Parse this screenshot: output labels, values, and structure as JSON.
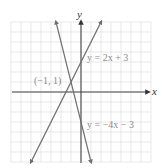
{
  "chart_data": {
    "type": "line",
    "title": "",
    "xlabel": "x",
    "ylabel": "y",
    "xlim": [
      -7,
      7
    ],
    "ylim": [
      -7,
      7
    ],
    "grid": true,
    "legend": null,
    "series": [
      {
        "name": "y = 2x + 3",
        "equation": "y = 2x + 3",
        "slope": 2,
        "intercept": 3,
        "x": [
          -5,
          2
        ],
        "y": [
          -7,
          7
        ]
      },
      {
        "name": "y = −4x − 3",
        "equation": "y = −4x − 3",
        "slope": -4,
        "intercept": -3,
        "x": [
          -2.5,
          1
        ],
        "y": [
          7,
          -7
        ]
      }
    ],
    "annotations": [
      {
        "text": "(−1, 1)",
        "x": -1,
        "y": 1,
        "type": "intersection-point"
      },
      {
        "text": "y = 2x + 3",
        "x": 0.6,
        "y": 3
      },
      {
        "text": "y = −4x − 3",
        "x": 0.6,
        "y": -3
      }
    ]
  },
  "labels": {
    "x_axis": "x",
    "y_axis": "y",
    "line1": "y = 2x + 3",
    "line2": "y = −4x − 3",
    "intersection": "(−1, 1)"
  }
}
